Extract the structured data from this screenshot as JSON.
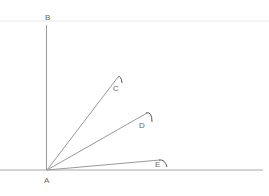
{
  "diagram": {
    "type": "angles-from-common-vertex",
    "stroke_color": "#9a9a9a",
    "guide_color": "#f2f2f2",
    "points": {
      "A": {
        "label": "A",
        "x": 47,
        "y": 170
      },
      "B": {
        "label": "B",
        "x": 47,
        "y": 25
      },
      "C": {
        "label": "C",
        "x": 118,
        "y": 77
      },
      "D": {
        "label": "D",
        "x": 147,
        "y": 113
      },
      "E": {
        "label": "E",
        "x": 160,
        "y": 160
      }
    },
    "labels": {
      "A": "A",
      "B": "B",
      "C": "C",
      "D": "D",
      "E": "E"
    },
    "rays": [
      {
        "from": "A",
        "to": "B"
      },
      {
        "from": "A",
        "to": "C"
      },
      {
        "from": "A",
        "to": "D"
      },
      {
        "from": "A",
        "to": "E"
      }
    ],
    "baseline": {
      "x1": 0,
      "x2": 263,
      "y": 170
    }
  }
}
